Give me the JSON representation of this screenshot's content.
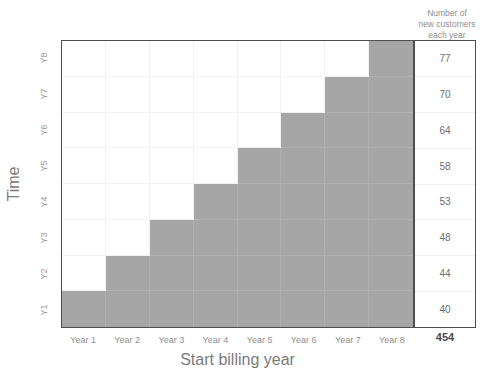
{
  "chart_data": {
    "type": "heatmap",
    "title": "",
    "xlabel": "Start billing year",
    "ylabel": "Time",
    "categories": [
      "Year 1",
      "Year 2",
      "Year 3",
      "Year 4",
      "Year 5",
      "Year 6",
      "Year 7",
      "Year 8"
    ],
    "y_categories": [
      "Y1",
      "Y2",
      "Y3",
      "Y4",
      "Y5",
      "Y6",
      "Y7",
      "Y8"
    ],
    "grid": true,
    "legend": "none",
    "filled_color": "#a6a6a6",
    "empty_color": "#ffffff",
    "note": "Lower-right triangular staircase: row Yn (counting from bottom) is filled from column n through column 8.",
    "matrix_bottom_to_top": [
      [
        1,
        1,
        1,
        1,
        1,
        1,
        1,
        1
      ],
      [
        0,
        1,
        1,
        1,
        1,
        1,
        1,
        1
      ],
      [
        0,
        0,
        1,
        1,
        1,
        1,
        1,
        1
      ],
      [
        0,
        0,
        0,
        1,
        1,
        1,
        1,
        1
      ],
      [
        0,
        0,
        0,
        0,
        1,
        1,
        1,
        1
      ],
      [
        0,
        0,
        0,
        0,
        0,
        1,
        1,
        1
      ],
      [
        0,
        0,
        0,
        0,
        0,
        0,
        1,
        1
      ],
      [
        0,
        0,
        0,
        0,
        0,
        0,
        0,
        1
      ]
    ],
    "side_table": {
      "header": [
        "Number of",
        "new customers",
        "each year"
      ],
      "rows_top_to_bottom": [
        {
          "time": "Y8",
          "value": "77"
        },
        {
          "time": "Y7",
          "value": "70"
        },
        {
          "time": "Y6",
          "value": "64"
        },
        {
          "time": "Y5",
          "value": "58"
        },
        {
          "time": "Y4",
          "value": "53"
        },
        {
          "time": "Y3",
          "value": "48"
        },
        {
          "time": "Y2",
          "value": "44"
        },
        {
          "time": "Y1",
          "value": "40"
        }
      ],
      "total": "454"
    }
  },
  "axes": {
    "y_title": "Time",
    "x_title": "Start billing year",
    "y_ticks_top_to_bottom": [
      "Y8",
      "Y7",
      "Y6",
      "Y5",
      "Y4",
      "Y3",
      "Y2",
      "Y1"
    ],
    "x_ticks": [
      "Year 1",
      "Year 2",
      "Year 3",
      "Year 4",
      "Year 5",
      "Year 6",
      "Year 7",
      "Year 8"
    ]
  },
  "side_panel": {
    "header_line1": "Number of",
    "header_line2": "new customers",
    "header_line3": "each year",
    "values_top_to_bottom": [
      "77",
      "70",
      "64",
      "58",
      "53",
      "48",
      "44",
      "40"
    ],
    "total": "454"
  },
  "colors": {
    "filled": "#a6a6a6",
    "gridline": "#f2f2f2",
    "border": "#4d4d4d",
    "text": "#7a7a7a"
  },
  "title_remnant": ""
}
